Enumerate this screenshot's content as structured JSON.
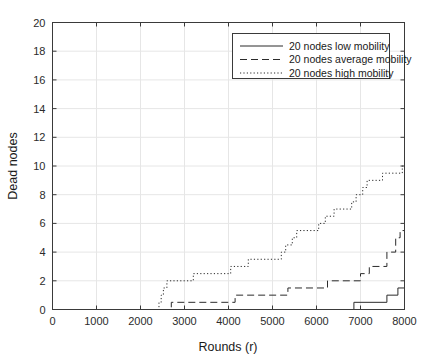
{
  "chart_data": {
    "type": "line",
    "title": "",
    "subtitle": "",
    "xlabel": "Rounds (r)",
    "ylabel": "Dead nodes",
    "xlim": [
      0,
      8000
    ],
    "ylim": [
      0,
      20
    ],
    "xticks": [
      0,
      1000,
      2000,
      3000,
      4000,
      5000,
      6000,
      7000,
      8000
    ],
    "xticklabels": [
      "0",
      "1000",
      "2000",
      "3000",
      "4000",
      "5000",
      "6000",
      "7000",
      "8000"
    ],
    "yticks": [
      0,
      2,
      4,
      6,
      8,
      10,
      12,
      14,
      16,
      18,
      20
    ],
    "yticklabels": [
      "0",
      "2",
      "4",
      "6",
      "8",
      "10",
      "12",
      "14",
      "16",
      "18",
      "20"
    ],
    "grid": true,
    "grid_color": "#e6e6e6",
    "legend_position": "top-right",
    "line_color": "#2b2b2b",
    "series": [
      {
        "name": "20 nodes low mobility",
        "style": "solid",
        "points": [
          [
            0,
            0
          ],
          [
            6850,
            0
          ],
          [
            6850,
            0.5
          ],
          [
            7600,
            0.5
          ],
          [
            7600,
            1.0
          ],
          [
            7850,
            1.0
          ],
          [
            7850,
            1.5
          ],
          [
            8000,
            1.5
          ]
        ]
      },
      {
        "name": "20 nodes average mobility",
        "style": "dashed",
        "points": [
          [
            0,
            0
          ],
          [
            2700,
            0
          ],
          [
            2700,
            0.5
          ],
          [
            4150,
            0.5
          ],
          [
            4150,
            1.0
          ],
          [
            5350,
            1.0
          ],
          [
            5350,
            1.5
          ],
          [
            6250,
            1.5
          ],
          [
            6250,
            2.0
          ],
          [
            7000,
            2.0
          ],
          [
            7000,
            2.5
          ],
          [
            7200,
            2.5
          ],
          [
            7200,
            3.0
          ],
          [
            7600,
            3.0
          ],
          [
            7600,
            4.0
          ],
          [
            7800,
            4.0
          ],
          [
            7800,
            5.0
          ],
          [
            7900,
            5.0
          ],
          [
            7900,
            5.5
          ],
          [
            8000,
            5.5
          ],
          [
            8000,
            6.0
          ]
        ]
      },
      {
        "name": "20 nodes high mobility",
        "style": "dotted",
        "points": [
          [
            0,
            0
          ],
          [
            2420,
            0
          ],
          [
            2420,
            0.5
          ],
          [
            2470,
            0.5
          ],
          [
            2470,
            1.0
          ],
          [
            2520,
            1.0
          ],
          [
            2520,
            1.5
          ],
          [
            2600,
            1.5
          ],
          [
            2600,
            2.0
          ],
          [
            3200,
            2.0
          ],
          [
            3200,
            2.5
          ],
          [
            4050,
            2.5
          ],
          [
            4050,
            3.0
          ],
          [
            4450,
            3.0
          ],
          [
            4450,
            3.5
          ],
          [
            5200,
            3.5
          ],
          [
            5200,
            4.0
          ],
          [
            5300,
            4.0
          ],
          [
            5300,
            4.5
          ],
          [
            5450,
            4.5
          ],
          [
            5450,
            5.0
          ],
          [
            5550,
            5.0
          ],
          [
            5550,
            5.5
          ],
          [
            6050,
            5.5
          ],
          [
            6050,
            6.0
          ],
          [
            6200,
            6.0
          ],
          [
            6200,
            6.5
          ],
          [
            6400,
            6.5
          ],
          [
            6400,
            7.0
          ],
          [
            6800,
            7.0
          ],
          [
            6800,
            7.5
          ],
          [
            6900,
            7.5
          ],
          [
            6900,
            8.0
          ],
          [
            7050,
            8.0
          ],
          [
            7050,
            8.5
          ],
          [
            7150,
            8.5
          ],
          [
            7150,
            9.0
          ],
          [
            7500,
            9.0
          ],
          [
            7500,
            9.5
          ],
          [
            7950,
            9.5
          ],
          [
            7950,
            10.0
          ],
          [
            8000,
            10.0
          ]
        ]
      }
    ]
  },
  "legend": {
    "entries": [
      {
        "label": "20 nodes low mobility",
        "style": "solid"
      },
      {
        "label": "20 nodes average mobility",
        "style": "dashed"
      },
      {
        "label": "20 nodes high mobility",
        "style": "dotted"
      }
    ]
  }
}
